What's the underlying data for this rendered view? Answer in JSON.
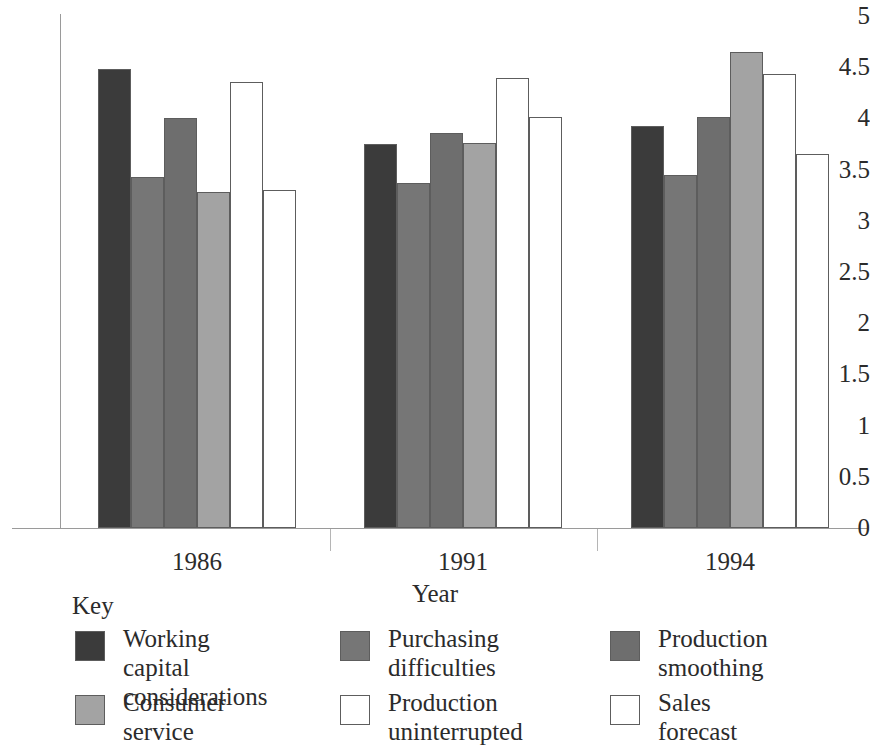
{
  "chart_data": {
    "type": "bar",
    "title": "",
    "xlabel": "Year",
    "ylabel": "",
    "categories": [
      "1986",
      "1991",
      "1994"
    ],
    "ylim": [
      0,
      5
    ],
    "yticks": [
      "0",
      "0.5",
      "1",
      "1.5",
      "2",
      "2.5",
      "3",
      "3.5",
      "4",
      "4.5",
      "5"
    ],
    "ytick_values": [
      0,
      0.5,
      1,
      1.5,
      2,
      2.5,
      3,
      3.5,
      4,
      4.5,
      5
    ],
    "grid": false,
    "legend_position": "below-plot",
    "legend_title": "Key",
    "series": [
      {
        "name": "Working capital\nconsiderations",
        "color": "#3b3b3b",
        "values": [
          4.48,
          3.75,
          3.93
        ]
      },
      {
        "name": "Purchasing\ndifficulties",
        "color": "#767676",
        "values": [
          3.43,
          3.37,
          3.45
        ]
      },
      {
        "name": "Production\nsmoothing",
        "color": "#6e6e6e",
        "values": [
          4.0,
          3.86,
          4.01
        ]
      },
      {
        "name": "Consumer\nservice",
        "color": "#a3a3a3",
        "values": [
          3.28,
          3.76,
          4.65
        ]
      },
      {
        "name": "Production\nuninterrupted",
        "color": "#ffffff",
        "values": [
          4.36,
          4.39,
          4.43
        ]
      },
      {
        "name": "Sales\nforecast",
        "color": "#ffffff",
        "values": [
          3.3,
          4.01,
          3.65
        ]
      }
    ]
  },
  "legend": {
    "title": "Key",
    "items": [
      {
        "label": "Working capital\nconsiderations",
        "color": "#3b3b3b"
      },
      {
        "label": "Purchasing\ndifficulties",
        "color": "#767676"
      },
      {
        "label": "Production\nsmoothing",
        "color": "#6e6e6e"
      },
      {
        "label": "Consumer\nservice",
        "color": "#a3a3a3"
      },
      {
        "label": "Production\nuninterrupted",
        "color": "#ffffff"
      },
      {
        "label": "Sales\nforecast",
        "color": "#ffffff"
      }
    ]
  }
}
